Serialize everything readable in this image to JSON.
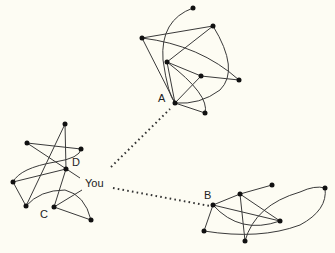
{
  "diagram": {
    "type": "social-network-clusters",
    "background": "#fdfcf3",
    "labels": {
      "you": "You",
      "a": "A",
      "b": "B",
      "c": "C",
      "d": "D"
    },
    "clusters": [
      {
        "name": "cluster-A",
        "node_count": 8,
        "bridge_node": "A"
      },
      {
        "name": "cluster-B",
        "node_count": 7,
        "bridge_node": "B"
      },
      {
        "name": "cluster-you",
        "node_count": 8,
        "members": [
          "You",
          "C",
          "D"
        ]
      }
    ],
    "weak_ties": [
      {
        "from": "You",
        "to": "A",
        "style": "dotted"
      },
      {
        "from": "You",
        "to": "B",
        "style": "dotted"
      }
    ]
  }
}
